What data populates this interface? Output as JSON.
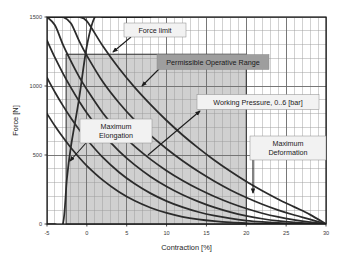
{
  "chart_data": {
    "type": "line",
    "title": "",
    "xlabel": "Contraction [%]",
    "ylabel": "Force [N]",
    "xlim": [
      -5,
      30
    ],
    "ylim": [
      0,
      1500
    ],
    "xticks": [
      -5,
      0,
      5,
      10,
      15,
      20,
      25,
      30
    ],
    "xtick_labels": [
      "-5",
      "0",
      "5",
      "10",
      "15",
      "20",
      "25",
      "30"
    ],
    "yticks": [
      0,
      500,
      1000,
      1500
    ],
    "ytick_labels": [
      "0",
      "500",
      "1000",
      "1500"
    ],
    "x_minor_step": 1,
    "y_minor_step": 100,
    "grid": true,
    "legend_position": "none",
    "series_description": "Isobaric force-contraction curves of a pneumatic muscle for working pressures 0 to 6 bar",
    "series": [
      {
        "name": "6 bar",
        "x": [
          -5,
          -4,
          -3,
          -2,
          -1,
          0,
          2,
          4,
          6,
          8,
          10,
          12,
          14,
          16,
          18,
          20,
          22,
          24,
          26,
          28,
          30
        ],
        "values": [
          1500,
          1500,
          1500,
          1500,
          1500,
          1470,
          1290,
          1130,
          990,
          865,
          750,
          645,
          550,
          462,
          382,
          308,
          241,
          180,
          124,
          68,
          0
        ]
      },
      {
        "name": "5 bar",
        "x": [
          -5,
          -4,
          -3,
          -2,
          -1,
          0,
          2,
          4,
          6,
          8,
          10,
          12,
          14,
          16,
          18,
          20,
          22,
          24,
          26,
          28,
          30
        ],
        "values": [
          1500,
          1500,
          1500,
          1455,
          1330,
          1220,
          1030,
          880,
          752,
          642,
          545,
          458,
          380,
          310,
          247,
          192,
          143,
          101,
          65,
          33,
          0
        ]
      },
      {
        "name": "4 bar",
        "x": [
          -5,
          -4,
          -3,
          -2,
          -1,
          0,
          2,
          4,
          6,
          8,
          10,
          12,
          14,
          16,
          18,
          20,
          22,
          24,
          26,
          28,
          30
        ],
        "values": [
          1500,
          1440,
          1300,
          1180,
          1070,
          975,
          805,
          672,
          562,
          468,
          386,
          315,
          253,
          199,
          152,
          112,
          78,
          51,
          30,
          13,
          0
        ]
      },
      {
        "name": "3 bar",
        "x": [
          -5,
          -4,
          -3,
          -2,
          -1,
          0,
          2,
          4,
          6,
          8,
          10,
          12,
          14,
          16,
          18,
          20,
          22,
          24,
          26,
          28,
          30
        ],
        "values": [
          1330,
          1205,
          1092,
          988,
          892,
          805,
          655,
          530,
          428,
          343,
          272,
          212,
          162,
          120,
          86,
          59,
          38,
          22,
          11,
          4,
          0
        ]
      },
      {
        "name": "2 bar",
        "x": [
          -5,
          -4,
          -3,
          -2,
          -1,
          0,
          2,
          4,
          6,
          8,
          10,
          12,
          14,
          16,
          18,
          20,
          22,
          24,
          26,
          28,
          30
        ],
        "values": [
          1060,
          955,
          858,
          768,
          686,
          612,
          482,
          377,
          291,
          222,
          166,
          122,
          87,
          60,
          40,
          25,
          15,
          8,
          3,
          1,
          0
        ]
      },
      {
        "name": "1 bar",
        "x": [
          -5,
          -4,
          -3,
          -2,
          -1,
          0,
          2,
          4,
          6,
          8,
          10,
          12,
          14,
          16,
          18,
          20,
          22,
          24,
          26,
          28,
          30
        ],
        "values": [
          800,
          710,
          628,
          552,
          484,
          422,
          318,
          234,
          168,
          118,
          80,
          52,
          33,
          20,
          11,
          6,
          3,
          1,
          0,
          0,
          0
        ]
      },
      {
        "name": "0 bar",
        "x": [
          -5,
          -4,
          -3,
          -2.5,
          -2,
          -1,
          0,
          1,
          2,
          3,
          4,
          5,
          6,
          7,
          8
        ],
        "values": [
          0,
          0,
          0,
          330,
          560,
          900,
          1290,
          1500,
          1500,
          1500,
          1500,
          1500,
          1500,
          1500,
          1500
        ]
      }
    ],
    "shaded_region": {
      "label": "Permissible Operative Range",
      "x_min": -2.6,
      "x_max": 20,
      "y_min": 0,
      "y_max": 1230,
      "fill": "#d0d0d0"
    },
    "annotations": [
      {
        "id": "force-limit",
        "text": "Force limit",
        "box_fill": "#f2f2f2",
        "anchor_x": 3.0,
        "anchor_y": 1220
      },
      {
        "id": "permissible-operative-range",
        "text": "Permissible Operative Range",
        "box_fill": "#9e9e9e",
        "anchor_x": 7.5,
        "anchor_y": 960
      },
      {
        "id": "working-pressure",
        "text": "Working Pressure, 0..6 [bar]",
        "box_fill": "#f2f2f2",
        "anchor_x": 12.0,
        "anchor_y": 680
      },
      {
        "id": "maximum-elongation",
        "text1": "Maximum",
        "text2": "Elongation",
        "box_fill": "#f2f2f2",
        "anchor_x": -2.6,
        "anchor_y": 360
      },
      {
        "id": "maximum-deformation",
        "text1": "Maximum",
        "text2": "Deformation",
        "box_fill": "#f2f2f2",
        "anchor_x": 20.0,
        "anchor_y": 180
      }
    ],
    "colors": {
      "curve": "#2b2b2b",
      "grid_minor": "#9a9a9a",
      "grid_major": "#6e6e6e",
      "axis": "#1a1a1a",
      "shade": "#d0d0d0",
      "plot_bg": "#ffffff",
      "page_bg": "#ffffff"
    }
  }
}
